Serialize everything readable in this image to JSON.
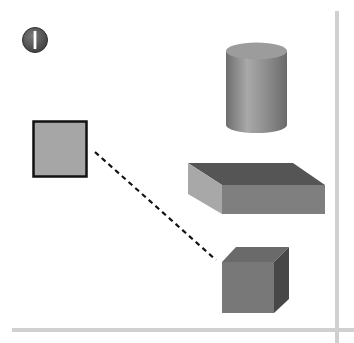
{
  "diagram": {
    "badge": {
      "label": "I",
      "icon": "roman-numeral-one-badge-icon",
      "color": "#5a5a5a"
    },
    "shapes": [
      {
        "name": "square",
        "type": "2d-square",
        "fill": "#a6a6a6",
        "stroke": "#111111"
      },
      {
        "name": "cylinder",
        "type": "3d-cylinder",
        "fill": "#8f8f8f"
      },
      {
        "name": "slab",
        "type": "3d-rectangular-prism",
        "fill": "#7d7d7d"
      },
      {
        "name": "cube",
        "type": "3d-cube",
        "fill": "#747474"
      }
    ],
    "connector": {
      "from": "square",
      "to": "cube",
      "style": "dashed"
    },
    "axes": {
      "color": "#d0d0d0"
    }
  }
}
